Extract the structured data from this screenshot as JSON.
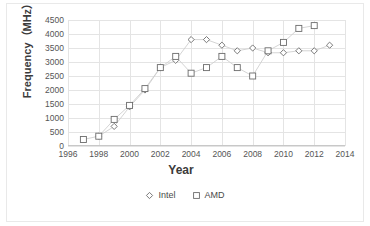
{
  "chart_data": {
    "type": "scatter",
    "title": "",
    "xlabel": "Year",
    "ylabel": "Frequency（MHz）",
    "xlim": [
      1996,
      2014
    ],
    "ylim": [
      0,
      4500
    ],
    "xticks": [
      "1996",
      "1998",
      "2000",
      "2002",
      "2004",
      "2006",
      "2008",
      "2010",
      "2012",
      "2014"
    ],
    "yticks": [
      "0",
      "500",
      "1000",
      "1500",
      "2000",
      "2500",
      "3000",
      "3500",
      "4000",
      "4500"
    ],
    "grid": true,
    "legend_position": "bottom",
    "series": [
      {
        "name": "Intel",
        "marker": "diamond",
        "color": "#6b6b6b",
        "x": [
          1998,
          1999,
          2000,
          2001,
          2002,
          2003,
          2004,
          2005,
          2006,
          2007,
          2008,
          2009,
          2010,
          2011,
          2012,
          2013
        ],
        "values": [
          350,
          700,
          1400,
          2000,
          2800,
          3060,
          3800,
          3800,
          3600,
          3400,
          3500,
          3330,
          3330,
          3400,
          3400,
          3600
        ]
      },
      {
        "name": "AMD",
        "marker": "square",
        "color": "#6b6b6b",
        "x": [
          1997,
          1998,
          1999,
          2000,
          2001,
          2002,
          2003,
          2004,
          2005,
          2006,
          2007,
          2008,
          2009,
          2010,
          2011,
          2012
        ],
        "values": [
          233,
          350,
          950,
          1450,
          2050,
          2800,
          3200,
          2600,
          2800,
          3200,
          2800,
          2500,
          3400,
          3700,
          4200,
          4300
        ]
      }
    ]
  },
  "axis": {
    "x_title": "Year",
    "y_title": "Frequency（MHz）"
  },
  "legend": {
    "items": [
      {
        "label": "Intel",
        "marker": "diamond-marker-icon"
      },
      {
        "label": "AMD",
        "marker": "square-marker-icon"
      }
    ]
  },
  "colors": {
    "gridline": "#e4e4e4",
    "axis": "#c8c8c8",
    "marker_stroke": "#6b6b6b",
    "series_line": "#cfcfcf",
    "tick_text": "#555555",
    "title_text": "#3b3b3b",
    "background": "#ffffff"
  }
}
